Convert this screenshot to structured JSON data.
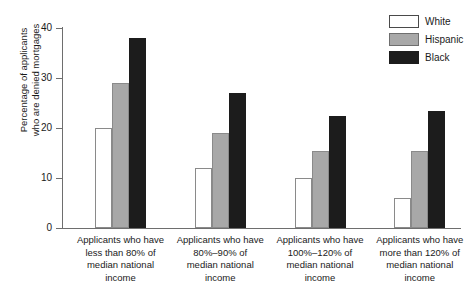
{
  "chart_data": {
    "type": "bar",
    "title": "",
    "xlabel": "",
    "ylabel": "Percentage of applicants\nwho are denied mortgages",
    "ylim": [
      0,
      40
    ],
    "ytick_values": [
      0,
      10,
      20,
      30,
      40
    ],
    "ytick_labels": [
      "0",
      "10",
      "20",
      "30",
      "40"
    ],
    "grid": false,
    "legend_position": "top-right",
    "categories": [
      "Applicants who have\nless than 80% of\nmedian national\nincome",
      "Applicants who have\n80%–90% of\nmedian national\nincome",
      "Applicants who have\n100%–120% of\nmedian national\nincome",
      "Applicants who have\nmore than 120% of\nmedian national\nincome"
    ],
    "series": [
      {
        "name": "White",
        "color": "#ffffff",
        "values": [
          20,
          12,
          10,
          6
        ]
      },
      {
        "name": "Hispanic",
        "color": "#a8a8a8",
        "values": [
          29,
          19,
          15.5,
          15.5
        ]
      },
      {
        "name": "Black",
        "color": "#1c1c1c",
        "values": [
          38,
          27,
          22.5,
          23.5
        ]
      }
    ]
  },
  "legend": {
    "items": [
      {
        "label": "White",
        "swatch": "white"
      },
      {
        "label": "Hispanic",
        "swatch": "hispanic"
      },
      {
        "label": "Black",
        "swatch": "black"
      }
    ]
  },
  "colors": {
    "white_bar": "#ffffff",
    "hispanic_bar": "#a8a8a8",
    "black_bar": "#1c1c1c",
    "axis": "#6e6e6e",
    "text": "#1a1a1a",
    "background": "#ffffff"
  }
}
